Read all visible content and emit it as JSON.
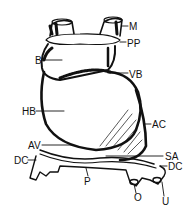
{
  "diagram": {
    "type": "anatomical line drawing",
    "ink_color": "#111111",
    "background": "#ffffff",
    "labels": [
      {
        "id": "M",
        "text": "M",
        "x": 129,
        "y": 22
      },
      {
        "id": "PP",
        "text": "PP",
        "x": 127,
        "y": 39
      },
      {
        "id": "B",
        "text": "B",
        "x": 35,
        "y": 56
      },
      {
        "id": "VB",
        "text": "VB",
        "x": 129,
        "y": 70
      },
      {
        "id": "HB",
        "text": "HB",
        "x": 22,
        "y": 107
      },
      {
        "id": "AC",
        "text": "AC",
        "x": 152,
        "y": 120
      },
      {
        "id": "AV",
        "text": "AV",
        "x": 28,
        "y": 141
      },
      {
        "id": "SA",
        "text": "SA",
        "x": 165,
        "y": 152
      },
      {
        "id": "DC_left",
        "text": "DC",
        "x": 14,
        "y": 156
      },
      {
        "id": "DC_right",
        "text": "DC",
        "x": 168,
        "y": 162
      },
      {
        "id": "P",
        "text": "P",
        "x": 84,
        "y": 177
      },
      {
        "id": "O",
        "text": "O",
        "x": 134,
        "y": 193
      },
      {
        "id": "U",
        "text": "U",
        "x": 162,
        "y": 197
      }
    ]
  }
}
